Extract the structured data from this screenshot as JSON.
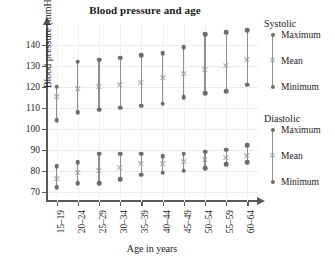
{
  "chart_data": {
    "type": "scatter",
    "title": "Blood pressure and age",
    "xlabel": "Age in years",
    "ylabel": "Blood pressure (mmHg)",
    "categories": [
      "15–19",
      "20–24",
      "25–29",
      "30–34",
      "35–39",
      "40–44",
      "45–49",
      "50–54",
      "55–59",
      "60–64"
    ],
    "ylim": [
      65,
      150
    ],
    "yticks": [
      70,
      80,
      90,
      100,
      110,
      120,
      130,
      140
    ],
    "grid": true,
    "legend_position": "right",
    "series": [
      {
        "name": "Systolic Maximum",
        "group": "Systolic",
        "role": "Maximum",
        "marker": "dot",
        "values": [
          120,
          132,
          133,
          134,
          135,
          136,
          139,
          145,
          146,
          147
        ]
      },
      {
        "name": "Systolic Mean",
        "group": "Systolic",
        "role": "Mean",
        "marker": "mean",
        "values": [
          115,
          119,
          120,
          121,
          122,
          124,
          126,
          128,
          130,
          133
        ]
      },
      {
        "name": "Systolic Minimum",
        "group": "Systolic",
        "role": "Minimum",
        "marker": "dot",
        "values": [
          104,
          108,
          109,
          110,
          111,
          112,
          115,
          117,
          118,
          121
        ]
      },
      {
        "name": "Diastolic Maximum",
        "group": "Diastolic",
        "role": "Maximum",
        "marker": "dot",
        "values": [
          82,
          84,
          88,
          88,
          88,
          87,
          88,
          89,
          90,
          92
        ]
      },
      {
        "name": "Diastolic Mean",
        "group": "Diastolic",
        "role": "Mean",
        "marker": "mean",
        "values": [
          76,
          79,
          80,
          81,
          83,
          83,
          84,
          85,
          86,
          87
        ]
      },
      {
        "name": "Diastolic Minimum",
        "group": "Diastolic",
        "role": "Minimum",
        "marker": "dot",
        "values": [
          72,
          74,
          74,
          76,
          78,
          79,
          80,
          81,
          83,
          84
        ]
      }
    ]
  },
  "legend": {
    "systolic": {
      "title": "Systolic",
      "items": [
        "Maximum",
        "Mean",
        "Minimum"
      ]
    },
    "diastolic": {
      "title": "Diastolic",
      "items": [
        "Maximum",
        "Mean",
        "Minimum"
      ]
    }
  }
}
